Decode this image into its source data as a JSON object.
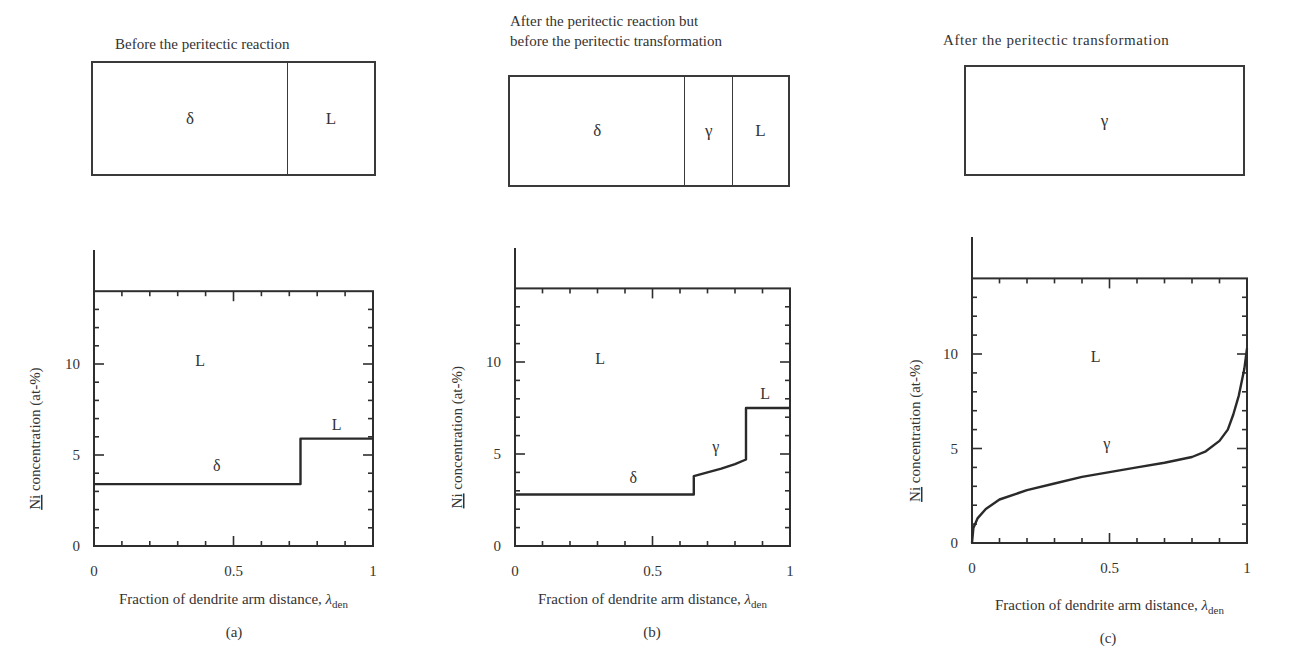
{
  "panels": [
    {
      "id": "a",
      "title_lines": [
        "Before the peritectic reaction"
      ],
      "schematic": [
        {
          "label": "δ",
          "width_frac": 0.69
        },
        {
          "label": "L",
          "width_frac": 0.31
        }
      ],
      "caption": "(a)"
    },
    {
      "id": "b",
      "title_lines": [
        "After the peritectic reaction but",
        "before the peritectic transformation"
      ],
      "schematic": [
        {
          "label": "δ",
          "width_frac": 0.627
        },
        {
          "label": "γ",
          "width_frac": 0.172
        },
        {
          "label": "L",
          "width_frac": 0.201
        }
      ],
      "caption": "(b)"
    },
    {
      "id": "c",
      "title_lines": [
        "After the peritectic transformation"
      ],
      "schematic": [
        {
          "label": "γ",
          "width_frac": 1.0
        }
      ],
      "caption": "(c)"
    }
  ],
  "axes": {
    "ylabel_prefix": "Ni",
    "ylabel_rest": " concentration (at-%)",
    "xlabel_main": "Fraction of dendrite arm distance, ",
    "xlabel_symbol": "λ",
    "xlabel_sub": "den",
    "xticks": [
      "0",
      "0.5",
      "1"
    ],
    "yticks": [
      "0",
      "5",
      "10"
    ]
  },
  "chart_data": [
    {
      "type": "line",
      "title": "Before the peritectic reaction",
      "xlabel": "Fraction of dendrite arm distance, λden",
      "ylabel": "Ni concentration (at-%)",
      "xlim": [
        0,
        1
      ],
      "ylim": [
        0,
        14
      ],
      "xticks": [
        0,
        0.5,
        1
      ],
      "yticks": [
        0,
        5,
        10
      ],
      "grid": false,
      "series": [
        {
          "name": "Ni profile",
          "x": [
            0,
            0.74,
            0.74,
            1
          ],
          "y": [
            3.4,
            3.4,
            5.9,
            5.9
          ]
        }
      ],
      "annotations": [
        {
          "text": "L",
          "x": 0.38,
          "y": 9.9
        },
        {
          "text": "δ",
          "x": 0.44,
          "y": 4.1
        },
        {
          "text": "L",
          "x": 0.87,
          "y": 6.4
        }
      ]
    },
    {
      "type": "line",
      "title": "After the peritectic reaction but before the peritectic transformation",
      "xlabel": "Fraction of dendrite arm distance, λden",
      "ylabel": "Ni concentration (at-%)",
      "xlim": [
        0,
        1
      ],
      "ylim": [
        0,
        14
      ],
      "xticks": [
        0,
        0.5,
        1
      ],
      "yticks": [
        0,
        5,
        10
      ],
      "grid": false,
      "series": [
        {
          "name": "Ni profile",
          "x": [
            0,
            0.65,
            0.65,
            0.7,
            0.75,
            0.8,
            0.84,
            0.84,
            1
          ],
          "y": [
            2.8,
            2.8,
            3.8,
            4.0,
            4.2,
            4.45,
            4.7,
            7.5,
            7.5
          ]
        }
      ],
      "annotations": [
        {
          "text": "L",
          "x": 0.31,
          "y": 9.9
        },
        {
          "text": "δ",
          "x": 0.43,
          "y": 3.4
        },
        {
          "text": "γ",
          "x": 0.73,
          "y": 5.1
        },
        {
          "text": "L",
          "x": 0.91,
          "y": 8.0
        }
      ]
    },
    {
      "type": "line",
      "title": "After the peritectic transformation",
      "xlabel": "Fraction of dendrite arm distance, λden",
      "ylabel": "Ni concentration (at-%)",
      "xlim": [
        0,
        1
      ],
      "ylim": [
        0,
        14
      ],
      "xticks": [
        0,
        0.5,
        1
      ],
      "yticks": [
        0,
        5,
        10
      ],
      "grid": false,
      "series": [
        {
          "name": "Ni profile",
          "x": [
            0,
            0.005,
            0.02,
            0.05,
            0.1,
            0.2,
            0.3,
            0.4,
            0.5,
            0.6,
            0.7,
            0.8,
            0.85,
            0.9,
            0.93,
            0.95,
            0.97,
            0.99,
            1.0
          ],
          "y": [
            0,
            0.8,
            1.3,
            1.8,
            2.3,
            2.8,
            3.15,
            3.5,
            3.75,
            4.0,
            4.25,
            4.55,
            4.85,
            5.4,
            6.0,
            6.8,
            7.8,
            9.2,
            10.3
          ]
        }
      ],
      "annotations": [
        {
          "text": "L",
          "x": 0.45,
          "y": 9.6
        },
        {
          "text": "γ",
          "x": 0.49,
          "y": 5.0
        }
      ]
    }
  ]
}
